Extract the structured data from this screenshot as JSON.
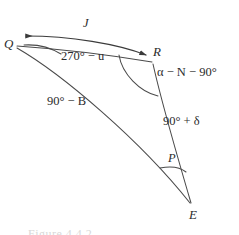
{
  "figure": {
    "type": "spherical-triangle-diagram",
    "background_color": "#ffffff",
    "stroke_color": "#4a4a4a",
    "text_color": "#2b2b2b",
    "width": 239,
    "height": 235,
    "caption_text": "Figure 4.4.2"
  },
  "vertices": [
    {
      "key": "Q",
      "label": "Q",
      "x": 13,
      "y": 45
    },
    {
      "key": "R",
      "label": "R",
      "x": 156,
      "y": 53
    },
    {
      "key": "E",
      "label": "E",
      "x": 193,
      "y": 216
    }
  ],
  "sides": [
    {
      "key": "QE",
      "label": "90° − B",
      "label_plain": "90 degrees minus B",
      "label_x": 60,
      "label_y": 102
    },
    {
      "key": "RE",
      "label": "90° + δ",
      "label_plain": "90 degrees plus delta",
      "label_x": 186,
      "label_y": 122
    },
    {
      "key": "QR",
      "label": "J",
      "label_plain": "J",
      "label_x": 85,
      "label_y": 24
    }
  ],
  "angles": [
    {
      "key": "angle-Q",
      "label": "270° − u",
      "label_plain": "270 degrees minus u",
      "vertex": "Q",
      "label_x": 63,
      "label_y": 56
    },
    {
      "key": "angle-R",
      "label": "α − N − 90°",
      "label_plain": "alpha minus N minus 90 degrees",
      "vertex": "R",
      "label_x": 162,
      "label_y": 72
    },
    {
      "key": "angle-E",
      "label": "P",
      "label_plain": "P",
      "vertex": "E",
      "label_x": 172,
      "label_y": 159
    }
  ],
  "arrow": {
    "name": "j-direction-arrow",
    "description": "double-headed arc from R to Q labelled J"
  }
}
